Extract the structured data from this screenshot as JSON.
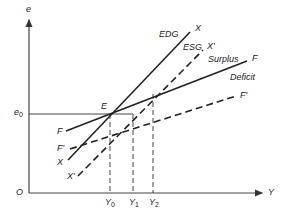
{
  "diagram": {
    "axes": {
      "y_label": "e",
      "x_label": "Y",
      "origin_label": "O"
    },
    "levels": {
      "e0": "e",
      "e0_sub": "0"
    },
    "x_marks": [
      {
        "label": "Y",
        "sub": "0"
      },
      {
        "label": "Y",
        "sub": "1"
      },
      {
        "label": "Y",
        "sub": "2"
      }
    ],
    "points": {
      "equilibrium": "E"
    },
    "curves": {
      "X": {
        "name": "X",
        "tag": "EDG",
        "style": "solid"
      },
      "X_prime": {
        "name": "X'",
        "tag": "ESG",
        "style": "dashed"
      },
      "F": {
        "name": "F",
        "style": "solid"
      },
      "F_prime": {
        "name": "F'",
        "style": "dashed"
      }
    },
    "regions": {
      "above_F": "Surplus",
      "below_F": "Deficit"
    },
    "colors": {
      "ink": "#222222",
      "axis": "#444444",
      "background": "#ffffff"
    }
  }
}
